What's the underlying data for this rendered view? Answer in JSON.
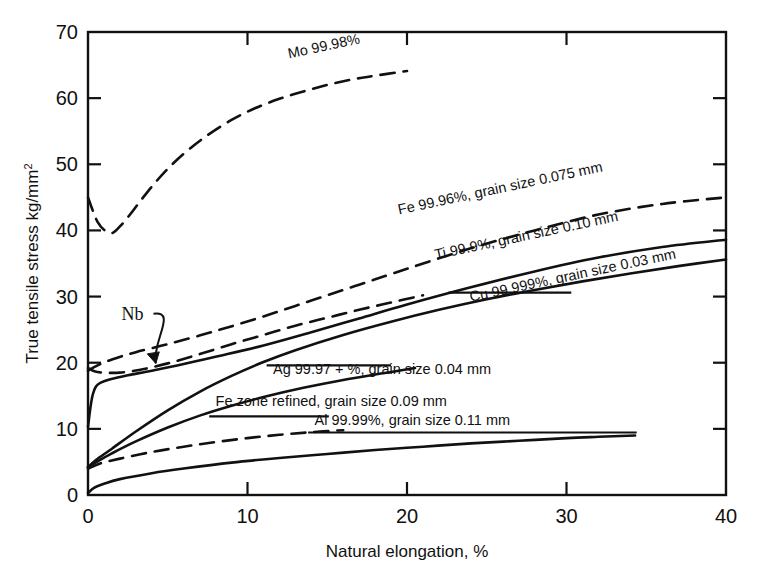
{
  "chart_data": {
    "type": "line",
    "title": "",
    "xlabel": "Natural elongation, %",
    "ylabel": "True tensile stress kg/mm",
    "ylabel_exponent": "2",
    "xlim": [
      0,
      40
    ],
    "ylim": [
      0,
      70
    ],
    "xticks": [
      0,
      10,
      20,
      30,
      40
    ],
    "yticks": [
      0,
      10,
      20,
      30,
      40,
      50,
      60,
      70
    ],
    "xtick_labels": [
      "0",
      "10",
      "20",
      "30",
      "40"
    ],
    "ytick_labels": [
      "0",
      "10",
      "20",
      "30",
      "40",
      "50",
      "60",
      "70"
    ],
    "grid": false,
    "legend_position": "inline-annotations",
    "frame": "box",
    "series": [
      {
        "name": "Mo 99.98%",
        "label": "Mo 99.98%",
        "style": "dashed",
        "label_x": 12.6,
        "label_y": 66.0,
        "label_rotation": -12,
        "points": [
          [
            0.0,
            45.0
          ],
          [
            0.3,
            43.0
          ],
          [
            0.6,
            41.3
          ],
          [
            1.0,
            40.1
          ],
          [
            1.5,
            39.6
          ],
          [
            2.0,
            40.6
          ],
          [
            2.6,
            42.3
          ],
          [
            3.3,
            44.5
          ],
          [
            4.2,
            47.2
          ],
          [
            5.2,
            49.8
          ],
          [
            6.3,
            52.2
          ],
          [
            7.5,
            54.4
          ],
          [
            9.0,
            56.7
          ],
          [
            10.5,
            58.5
          ],
          [
            12.0,
            59.9
          ],
          [
            13.5,
            61.0
          ],
          [
            15.0,
            62.0
          ],
          [
            16.5,
            62.8
          ],
          [
            18.0,
            63.4
          ],
          [
            20.0,
            64.1
          ]
        ]
      },
      {
        "name": "Fe 99.96%, grain size 0.075 mm",
        "label": "Fe 99.96%, grain size 0.075 mm",
        "style": "dashed",
        "label_x": 19.5,
        "label_y": 42.4,
        "label_rotation": -12,
        "points": [
          [
            0.0,
            18.8
          ],
          [
            0.6,
            19.6
          ],
          [
            1.5,
            20.5
          ],
          [
            3.0,
            21.6
          ],
          [
            5.0,
            22.8
          ],
          [
            8.0,
            24.8
          ],
          [
            11.0,
            27.0
          ],
          [
            14.0,
            29.4
          ],
          [
            17.0,
            31.8
          ],
          [
            20.0,
            34.2
          ],
          [
            24.0,
            37.3
          ],
          [
            28.0,
            40.0
          ],
          [
            32.0,
            42.4
          ],
          [
            36.0,
            44.0
          ],
          [
            40.0,
            45.0
          ]
        ]
      },
      {
        "name": "Ti 99.9%, grain size 0.10 mm",
        "label": "Ti 99.9%, grain size 0.10 mm",
        "style": "solid",
        "label_x": 21.8,
        "label_y": 35.6,
        "label_rotation": -12,
        "points": [
          [
            0.0,
            10.3
          ],
          [
            0.15,
            13.2
          ],
          [
            0.3,
            15.2
          ],
          [
            0.5,
            16.4
          ],
          [
            0.8,
            17.0
          ],
          [
            1.4,
            17.5
          ],
          [
            2.5,
            18.1
          ],
          [
            4.0,
            18.8
          ],
          [
            6.0,
            19.8
          ],
          [
            8.0,
            20.9
          ],
          [
            11.0,
            22.6
          ],
          [
            14.0,
            24.6
          ],
          [
            17.0,
            26.7
          ],
          [
            20.0,
            28.8
          ],
          [
            24.0,
            31.4
          ],
          [
            28.0,
            33.8
          ],
          [
            32.0,
            35.9
          ],
          [
            36.0,
            37.5
          ],
          [
            40.0,
            38.6
          ]
        ]
      },
      {
        "name": "Cu 99.999%, grain size 0.03 mm",
        "label": "Cu 99.999%, grain size 0.03 mm",
        "style": "solid",
        "label_x": 24.0,
        "label_y": 29.2,
        "label_rotation": -12,
        "points": [
          [
            0.0,
            4.2
          ],
          [
            0.5,
            5.3
          ],
          [
            1.5,
            7.0
          ],
          [
            3.0,
            9.6
          ],
          [
            5.0,
            12.8
          ],
          [
            7.0,
            15.6
          ],
          [
            9.0,
            18.0
          ],
          [
            11.0,
            20.1
          ],
          [
            13.0,
            21.9
          ],
          [
            16.0,
            24.2
          ],
          [
            19.0,
            26.2
          ],
          [
            22.0,
            28.0
          ],
          [
            25.0,
            29.6
          ],
          [
            28.0,
            31.0
          ],
          [
            31.0,
            32.3
          ],
          [
            34.0,
            33.5
          ],
          [
            37.0,
            34.6
          ],
          [
            40.0,
            35.6
          ]
        ]
      },
      {
        "name": "Ag 99.97 + %, grain size 0.04 mm",
        "label": "Ag 99.97 + %, grain size 0.04 mm",
        "style": "solid",
        "label_x": 11.6,
        "label_y": 18.3,
        "label_rotation": 0,
        "points": [
          [
            0.0,
            4.2
          ],
          [
            0.6,
            5.1
          ],
          [
            1.5,
            6.3
          ],
          [
            3.0,
            8.1
          ],
          [
            5.0,
            10.2
          ],
          [
            7.0,
            12.0
          ],
          [
            9.0,
            13.5
          ],
          [
            11.0,
            14.8
          ],
          [
            13.5,
            16.2
          ],
          [
            16.0,
            17.4
          ],
          [
            18.5,
            18.4
          ],
          [
            20.5,
            19.2
          ]
        ]
      },
      {
        "name": "Fe zone refined, grain size 0.09 mm",
        "label": "Fe zone refined, grain size 0.09 mm",
        "style": "dashed",
        "label_x": 8.0,
        "label_y": 13.4,
        "label_rotation": 0,
        "points": [
          [
            0.0,
            4.0
          ],
          [
            0.8,
            4.8
          ],
          [
            2.0,
            5.5
          ],
          [
            4.0,
            6.5
          ],
          [
            6.0,
            7.3
          ],
          [
            8.0,
            8.0
          ],
          [
            10.0,
            8.6
          ],
          [
            12.0,
            9.1
          ],
          [
            14.0,
            9.5
          ],
          [
            16.0,
            9.8
          ]
        ]
      },
      {
        "name": "Al 99.99%, grain size 0.11 mm",
        "label": "Al 99.99%, grain size 0.11 mm",
        "style": "solid",
        "label_x": 14.2,
        "label_y": 10.6,
        "label_rotation": 0,
        "points": [
          [
            0.0,
            0.3
          ],
          [
            0.4,
            1.1
          ],
          [
            1.0,
            1.7
          ],
          [
            2.0,
            2.4
          ],
          [
            4.0,
            3.3
          ],
          [
            6.0,
            4.0
          ],
          [
            9.0,
            4.9
          ],
          [
            12.0,
            5.6
          ],
          [
            15.0,
            6.2
          ],
          [
            18.0,
            6.8
          ],
          [
            21.0,
            7.3
          ],
          [
            24.0,
            7.8
          ],
          [
            27.0,
            8.2
          ],
          [
            30.0,
            8.6
          ],
          [
            32.0,
            8.8
          ],
          [
            34.3,
            9.0
          ]
        ]
      },
      {
        "name": "Nb",
        "label": "Nb",
        "style": "dashed",
        "label_x": 2.1,
        "label_y": 26.5,
        "label_rotation": 0,
        "annotation": "arrow-pointing-down-right",
        "points": [
          [
            0.0,
            19.2
          ],
          [
            0.4,
            18.7
          ],
          [
            1.0,
            18.5
          ],
          [
            2.0,
            18.5
          ],
          [
            3.2,
            18.9
          ],
          [
            5.0,
            19.9
          ],
          [
            7.0,
            21.3
          ],
          [
            9.0,
            22.8
          ],
          [
            11.0,
            24.2
          ],
          [
            13.0,
            25.6
          ],
          [
            15.0,
            26.8
          ],
          [
            17.0,
            28.0
          ],
          [
            19.0,
            29.1
          ],
          [
            21.0,
            30.2
          ]
        ]
      }
    ]
  },
  "axes": {
    "x_axis_title": "Natural elongation, %",
    "y_axis_title": "True tensile stress kg/mm",
    "y_axis_exponent": "2"
  },
  "colors": {
    "ink": "#111111",
    "background": "#ffffff"
  }
}
